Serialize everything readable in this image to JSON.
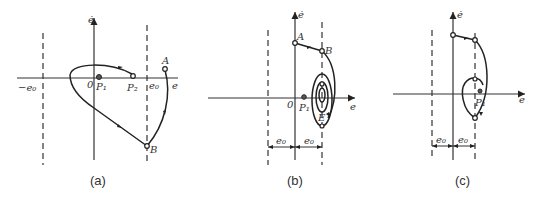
{
  "panels": [
    {
      "caption": "(a)",
      "axis_x_label": "e",
      "axis_y_label": "ė",
      "origin_label": "0",
      "labels": {
        "neg_e0": "−e₀",
        "e0": "e₀",
        "P1": "P₁",
        "P2": "P₂",
        "A": "A",
        "B": "B"
      }
    },
    {
      "caption": "(b)",
      "axis_x_label": "e",
      "axis_y_label": "ė",
      "origin_label": "0",
      "labels": {
        "P1": "P₁",
        "A": "A",
        "B": "B",
        "E": "E",
        "e0_left": "e₀",
        "e0_right": "e₀"
      }
    },
    {
      "caption": "(c)",
      "axis_x_label": "e",
      "axis_y_label": "ė",
      "labels": {
        "P1": "P₁",
        "e0_left": "e₀",
        "e0_right": "e₀"
      }
    }
  ]
}
